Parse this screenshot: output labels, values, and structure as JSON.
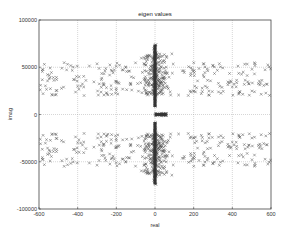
{
  "chart_data": {
    "type": "scatter",
    "title": "eigen values",
    "xlabel": "real",
    "ylabel": "imag",
    "xlim": [
      -600,
      600
    ],
    "ylim": [
      -100000,
      100000
    ],
    "xticks": [
      -600,
      -400,
      -200,
      0,
      200,
      400,
      600
    ],
    "yticks": [
      -100000,
      -50000,
      0,
      50000,
      100000
    ],
    "xtick_labels": [
      "-600",
      "-400",
      "-200",
      "0",
      "200",
      "400",
      "600"
    ],
    "ytick_labels": [
      "-100000",
      "-50000",
      "0",
      "50000",
      "100000"
    ],
    "grid": true,
    "grid_style": "dotted",
    "marker": "x",
    "marker_color": "#555555",
    "symmetric_about_real_axis": true,
    "series": [
      {
        "name": "eigenvalues (upper half, conjugate pairs mirrored)",
        "clusters": [
          {
            "desc": "dense column on imaginary axis",
            "x_range": [
              -8,
              8
            ],
            "y_range": [
              8000,
              74000
            ],
            "count": 60
          },
          {
            "desc": "dense core near imaginary axis",
            "x_center": 0,
            "x_spread": 110,
            "y_range": [
              20000,
              65000
            ],
            "count": 220
          },
          {
            "desc": "left wing",
            "x_range": [
              -600,
              -120
            ],
            "y_range": [
              20000,
              55000
            ],
            "count": 110
          },
          {
            "desc": "right wing",
            "x_range": [
              120,
              600
            ],
            "y_range": [
              20000,
              55000
            ],
            "count": 110
          }
        ]
      },
      {
        "name": "real-axis eigenvalues",
        "clusters": [
          {
            "desc": "short bar on real axis",
            "x_range": [
              0,
              60
            ],
            "y_range": [
              -1500,
              1500
            ],
            "count": 20
          }
        ]
      }
    ]
  }
}
